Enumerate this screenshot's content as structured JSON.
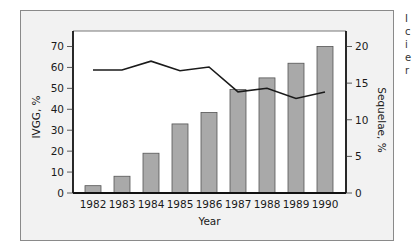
{
  "chart_data": {
    "type": "bar+line",
    "title": "",
    "categories": [
      "1982",
      "1983",
      "1984",
      "1985",
      "1986",
      "1987",
      "1988",
      "1989",
      "1990"
    ],
    "series": [
      {
        "name": "IVGG, %",
        "type": "bar",
        "axis": "left",
        "values": [
          3.5,
          8,
          19,
          33,
          38.5,
          49.5,
          55,
          62,
          70
        ]
      },
      {
        "name": "Sequelae, %",
        "type": "line",
        "axis": "right",
        "values": [
          16.8,
          16.8,
          18.0,
          16.7,
          17.2,
          13.8,
          14.3,
          12.9,
          13.8
        ]
      }
    ],
    "xlabel": "Year",
    "ylabel": "IVGG, %",
    "ylabel_right": "Sequelae, %",
    "ylim": [
      0,
      70
    ],
    "ylim_right": [
      0,
      20
    ],
    "yticks": [
      0,
      10,
      20,
      30,
      40,
      50,
      60,
      70
    ],
    "yticks_right": [
      0,
      5,
      10,
      15,
      20
    ],
    "grid": false,
    "legend": "none",
    "colors": {
      "bar_fill": "#a9a9a9",
      "bar_stroke": "#555555",
      "line": "#1a1a1a",
      "frame_bg": "#f2f2f2",
      "plot_bg": "#ffffff"
    }
  },
  "edge_fragments": [
    "I",
    "c",
    "i",
    "e",
    "r"
  ]
}
